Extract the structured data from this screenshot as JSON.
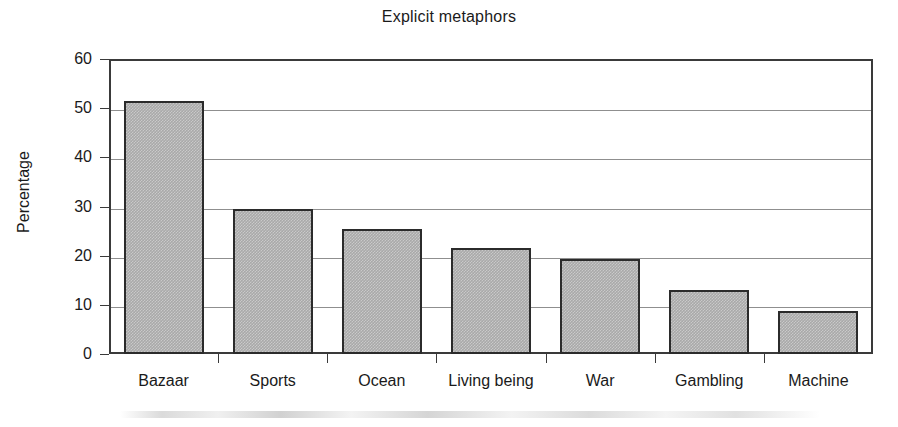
{
  "chart_data": {
    "type": "bar",
    "title": "Explicit metaphors",
    "xlabel": "",
    "ylabel": "Percentage",
    "categories": [
      "Bazaar",
      "Sports",
      "Ocean",
      "Living being",
      "War",
      "Gambling",
      "Machine"
    ],
    "values": [
      51.5,
      29.5,
      25.5,
      21.5,
      19.3,
      13.1,
      8.7
    ],
    "ylim": [
      0,
      60
    ],
    "ytick_labels": [
      "0",
      "10",
      "20",
      "30",
      "40",
      "50",
      "60"
    ],
    "ytick_values": [
      0,
      10,
      20,
      30,
      40,
      50,
      60
    ],
    "grid": "horizontal",
    "legend": "none",
    "bar_fill_color": "#a9a9a9",
    "bar_edge_color": "#2b2b2b",
    "axis_color": "#3a3a3a",
    "gridline_color": "#8f8f8f",
    "background_color": "#ffffff"
  }
}
